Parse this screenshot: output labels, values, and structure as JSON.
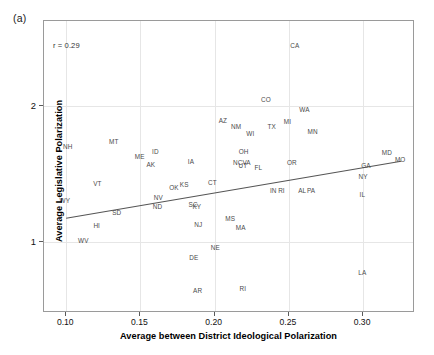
{
  "figure": {
    "panel_label": "(a)",
    "annotation": "r = 0.29"
  },
  "chart_data": {
    "type": "scatter",
    "title": "",
    "xlabel": "Average between District Ideological Polarization",
    "ylabel": "Average Legislative Polarization",
    "xlim": [
      0.085,
      0.335
    ],
    "ylim": [
      0.48,
      2.62
    ],
    "xticks": [
      0.1,
      0.15,
      0.2,
      0.25,
      0.3
    ],
    "xticklabels": [
      "0.10",
      "0.15",
      "0.20",
      "0.25",
      "0.30"
    ],
    "yticks": [
      1,
      2
    ],
    "yticklabels": [
      "1",
      "2"
    ],
    "grid": true,
    "legend": "none",
    "annotations": [
      "r = 0.29"
    ],
    "point_label_field": "state",
    "markers": "state-abbreviation-text",
    "trendline": {
      "type": "linear",
      "x": [
        0.1,
        0.327
      ],
      "y": [
        1.165,
        1.585
      ],
      "color": "#555555"
    },
    "points": [
      {
        "state": "CA",
        "x": 0.254,
        "y": 2.435
      },
      {
        "state": "CO",
        "x": 0.2345,
        "y": 2.04
      },
      {
        "state": "WA",
        "x": 0.2605,
        "y": 1.965
      },
      {
        "state": "MI",
        "x": 0.249,
        "y": 1.88
      },
      {
        "state": "AZ",
        "x": 0.2055,
        "y": 1.885
      },
      {
        "state": "NM",
        "x": 0.2145,
        "y": 1.845
      },
      {
        "state": "TX",
        "x": 0.2385,
        "y": 1.845
      },
      {
        "state": "MN",
        "x": 0.266,
        "y": 1.805
      },
      {
        "state": "WI",
        "x": 0.224,
        "y": 1.79
      },
      {
        "state": "NH",
        "x": 0.101,
        "y": 1.7
      },
      {
        "state": "MT",
        "x": 0.132,
        "y": 1.73
      },
      {
        "state": "ID",
        "x": 0.16,
        "y": 1.66
      },
      {
        "state": "ME",
        "x": 0.1495,
        "y": 1.62
      },
      {
        "state": "OH",
        "x": 0.2195,
        "y": 1.66
      },
      {
        "state": "MD",
        "x": 0.316,
        "y": 1.655
      },
      {
        "state": "MO",
        "x": 0.325,
        "y": 1.6
      },
      {
        "state": "IA",
        "x": 0.184,
        "y": 1.59
      },
      {
        "state": "AK",
        "x": 0.157,
        "y": 1.565
      },
      {
        "state": "NC",
        "x": 0.2155,
        "y": 1.58
      },
      {
        "state": "VA",
        "x": 0.2215,
        "y": 1.58
      },
      {
        "state": "UT",
        "x": 0.219,
        "y": 1.555
      },
      {
        "state": "FL",
        "x": 0.2295,
        "y": 1.54
      },
      {
        "state": "OR",
        "x": 0.252,
        "y": 1.58
      },
      {
        "state": "GA",
        "x": 0.302,
        "y": 1.555
      },
      {
        "state": "NY",
        "x": 0.3,
        "y": 1.48
      },
      {
        "state": "VT",
        "x": 0.121,
        "y": 1.425
      },
      {
        "state": "OK",
        "x": 0.1725,
        "y": 1.395
      },
      {
        "state": "KS",
        "x": 0.1795,
        "y": 1.415
      },
      {
        "state": "CT",
        "x": 0.1985,
        "y": 1.435
      },
      {
        "state": "IN",
        "x": 0.2395,
        "y": 1.375
      },
      {
        "state": "RI-dup",
        "x": 0.245,
        "y": 1.375
      },
      {
        "state": "AL",
        "x": 0.259,
        "y": 1.375
      },
      {
        "state": "PA",
        "x": 0.265,
        "y": 1.375
      },
      {
        "state": "IL",
        "x": 0.2995,
        "y": 1.345
      },
      {
        "state": "WY",
        "x": 0.099,
        "y": 1.3
      },
      {
        "state": "NV",
        "x": 0.162,
        "y": 1.325
      },
      {
        "state": "ND",
        "x": 0.1615,
        "y": 1.255
      },
      {
        "state": "SD",
        "x": 0.134,
        "y": 1.215
      },
      {
        "state": "SC",
        "x": 0.1855,
        "y": 1.27
      },
      {
        "state": "KY",
        "x": 0.188,
        "y": 1.255
      },
      {
        "state": "HI",
        "x": 0.1205,
        "y": 1.12
      },
      {
        "state": "NJ",
        "x": 0.189,
        "y": 1.125
      },
      {
        "state": "MS",
        "x": 0.2105,
        "y": 1.17
      },
      {
        "state": "MA",
        "x": 0.2175,
        "y": 1.105
      },
      {
        "state": "WV",
        "x": 0.1115,
        "y": 1.01
      },
      {
        "state": "NE",
        "x": 0.2005,
        "y": 0.955
      },
      {
        "state": "DE",
        "x": 0.186,
        "y": 0.885
      },
      {
        "state": "AR",
        "x": 0.1885,
        "y": 0.64
      },
      {
        "state": "RI",
        "x": 0.219,
        "y": 0.655
      },
      {
        "state": "LA",
        "x": 0.2995,
        "y": 0.77
      }
    ]
  }
}
